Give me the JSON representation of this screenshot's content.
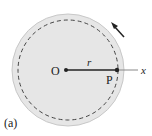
{
  "figure": {
    "panel_label": "(a)",
    "center_label": "O",
    "point_label": "P",
    "radius_label": "r",
    "axis_label": "x",
    "colors": {
      "disk_fill": "#e6e6e6",
      "disk_edge": "#c8c8c8",
      "line": "#222222",
      "axis": "#888888"
    },
    "rotation_direction": "counterclockwise"
  }
}
